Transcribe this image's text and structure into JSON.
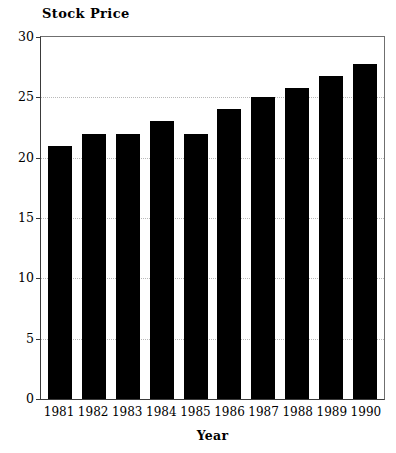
{
  "chart_data": {
    "type": "bar",
    "title": "Stock Price",
    "xlabel": "Year",
    "ylabel": "",
    "categories": [
      "1981",
      "1982",
      "1983",
      "1984",
      "1985",
      "1986",
      "1987",
      "1988",
      "1989",
      "1990"
    ],
    "values": [
      21,
      22,
      22,
      23,
      22,
      24,
      25,
      25.8,
      26.8,
      27.8
    ],
    "ylim": [
      0,
      30
    ],
    "yticks": [
      0,
      5,
      10,
      15,
      20,
      25,
      30
    ],
    "ytick_labels": [
      "0",
      "5",
      "10",
      "15",
      "20",
      "25",
      "30"
    ],
    "grid": true,
    "grid_axis": "y",
    "grid_style": "dotted",
    "legend": null,
    "bar_color": "#000000",
    "frame_color": "#3a3a3a",
    "gridline_color": "#b9b9b9",
    "background": "#ffffff"
  }
}
